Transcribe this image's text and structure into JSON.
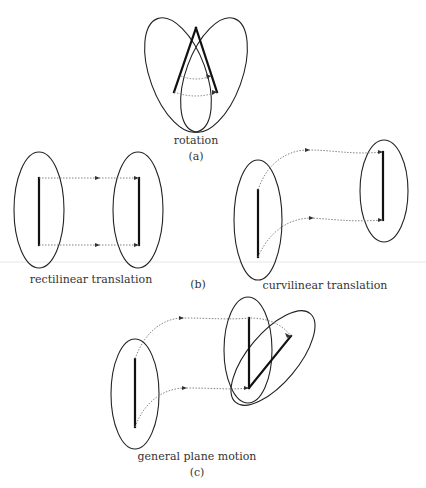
{
  "figure": {
    "panels": [
      {
        "id": "a",
        "caption": "rotation",
        "tag": "(a)"
      },
      {
        "id": "b_left",
        "caption": "rectilinear translation"
      },
      {
        "id": "b_tag",
        "tag": "(b)"
      },
      {
        "id": "b_right",
        "caption": "curvilinear translation"
      },
      {
        "id": "c",
        "caption": "general plane motion",
        "tag": "(c)"
      }
    ],
    "colors": {
      "outline": "#222222",
      "bar": "#111111",
      "trajectory": "#777777",
      "background": "#ffffff"
    }
  }
}
